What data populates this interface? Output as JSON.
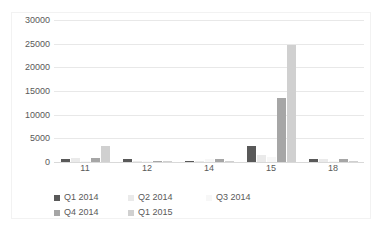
{
  "chart_data": {
    "type": "bar",
    "title": "",
    "xlabel": "",
    "ylabel": "",
    "ylim": [
      0,
      30000
    ],
    "ytick_labels": [
      "30000",
      "25000",
      "20000",
      "15000",
      "10000",
      "5000",
      "0"
    ],
    "ytick_values": [
      30000,
      25000,
      20000,
      15000,
      10000,
      5000,
      0
    ],
    "grid": true,
    "legend_position": "bottom",
    "categories": [
      "11",
      "12",
      "14",
      "15",
      "18"
    ],
    "series": [
      {
        "name": "Q1 2014",
        "color": "#595959",
        "values": [
          700,
          560,
          60,
          3400,
          700
        ]
      },
      {
        "name": "Q2 2014",
        "color": "#eaeaea",
        "values": [
          780,
          300,
          260,
          1550,
          720
        ]
      },
      {
        "name": "Q3 2014",
        "color": "#f7f7f7",
        "values": [
          120,
          60,
          630,
          1080,
          60
        ]
      },
      {
        "name": "Q4 2014",
        "color": "#a6a6a6",
        "values": [
          760,
          310,
          580,
          13550,
          690
        ]
      },
      {
        "name": "Q1 2015",
        "color": "#d0d0d0",
        "values": [
          3420,
          80,
          120,
          24800,
          150
        ]
      }
    ]
  }
}
